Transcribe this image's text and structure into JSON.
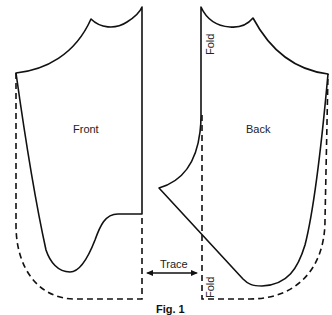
{
  "figure": {
    "caption": "Fig. 1",
    "pieces": [
      {
        "name": "front",
        "label": "Front"
      },
      {
        "name": "back",
        "label": "Back"
      }
    ],
    "annotations": {
      "fold_top": "Fold",
      "fold_bottom": "Fold",
      "trace": "Trace"
    },
    "colors": {
      "line": "#111111",
      "background": "#ffffff"
    }
  }
}
